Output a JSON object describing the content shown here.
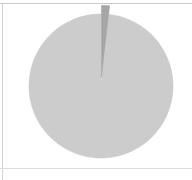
{
  "panel": {
    "background_color": "#ffffff",
    "border_color": "#cfcfcf"
  },
  "chart_data": {
    "type": "pie",
    "title": "",
    "subtitle": "",
    "xlabel": "",
    "ylabel": "",
    "grid": false,
    "legend_position": "none",
    "labels_shown": false,
    "start_angle_deg": 90,
    "direction": "counterclockwise",
    "center_px": [
      101,
      86
    ],
    "radius_px": 72,
    "categories": [
      "Majority",
      "Sliver"
    ],
    "values": [
      98.2,
      1.8
    ],
    "percentages": [
      "98.2%",
      "1.8%"
    ],
    "colors": [
      "#cccccc",
      "#a6a6a6"
    ],
    "explode": [
      0,
      0.12
    ],
    "exploded_slice_index": 1,
    "annotations": []
  },
  "slices": [
    {
      "name": "majority-slice",
      "value": 98.2,
      "color": "#cccccc",
      "stroke": "#c4c4c4",
      "exploded": false
    },
    {
      "name": "sliver-slice",
      "value": 1.8,
      "color": "#a6a6a6",
      "stroke": "#9a9a9a",
      "exploded": true
    }
  ],
  "accessibility": {
    "figure_description": "Pie chart with one dominant light gray slice and one thin exploded darker gray sliver pointing toward the lower left."
  }
}
